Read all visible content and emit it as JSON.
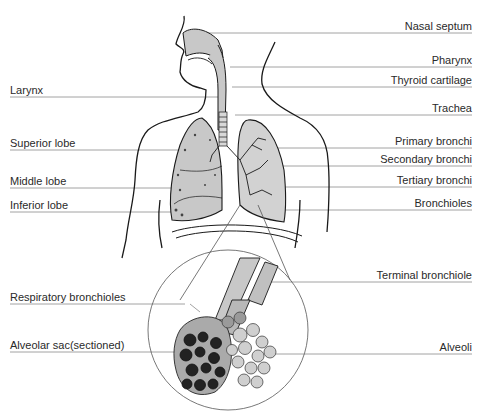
{
  "diagram": {
    "colors": {
      "line": "#8a8a8a",
      "fill": "#c8c8c8",
      "ink": "#1a1a1a",
      "dark": "#222222"
    },
    "labels_right": [
      {
        "id": "nasal-septum",
        "text": "Nasal septum",
        "y": 33
      },
      {
        "id": "pharynx",
        "text": "Pharynx",
        "y": 67
      },
      {
        "id": "thyroid-cartilage",
        "text": "Thyroid cartilage",
        "y": 87
      },
      {
        "id": "trachea",
        "text": "Trachea",
        "y": 115
      },
      {
        "id": "primary-bronchi",
        "text": "Primary bronchi",
        "y": 148
      },
      {
        "id": "secondary-bronchi",
        "text": "Secondary bronchi",
        "y": 166
      },
      {
        "id": "tertiary-bronchi",
        "text": "Tertiary bronchi",
        "y": 187
      },
      {
        "id": "bronchioles",
        "text": "Bronchioles",
        "y": 210
      },
      {
        "id": "terminal-bronchiole",
        "text": "Terminal bronchiole",
        "y": 282
      },
      {
        "id": "alveoli",
        "text": "Alveoli",
        "y": 354
      }
    ],
    "labels_left": [
      {
        "id": "larynx",
        "text": "Larynx",
        "y": 97
      },
      {
        "id": "superior-lobe",
        "text": "Superior lobe",
        "y": 150
      },
      {
        "id": "middle-lobe",
        "text": "Middle lobe",
        "y": 188
      },
      {
        "id": "inferior-lobe",
        "text": "Inferior lobe",
        "y": 212
      },
      {
        "id": "respiratory-bronchioles",
        "text": "Respiratory bronchioles",
        "y": 304
      },
      {
        "id": "alveolar-sac",
        "text": "Alveolar sac(sectioned)",
        "y": 352
      }
    ]
  }
}
